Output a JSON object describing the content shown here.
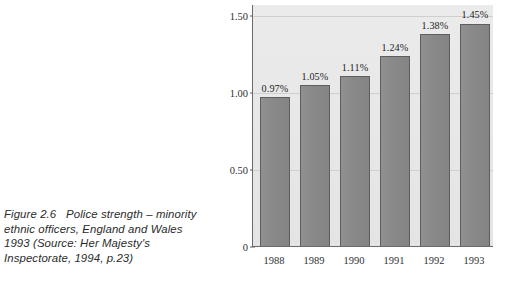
{
  "caption": {
    "lines": [
      "Figure 2.6   Police strength – minority",
      "ethnic officers, England and Wales",
      "1993 (Source: Her Majesty's",
      "Inspectorate, 1994, p.23)"
    ],
    "full_text": "Figure 2.6  Police strength – minority ethnic officers, England and Wales 1993 (Source: Her Majesty's Inspectorate, 1994, p.23)"
  },
  "colors": {
    "bar_fill": "#8b8b8b",
    "bar_border": "#5e5e5e",
    "plot_background": "#e8e8e8",
    "axis": "#6a6a6a",
    "gridline": "#cfcfcf",
    "text": "#2f2f2f",
    "page_background": "#ffffff"
  },
  "chart_data": {
    "type": "bar",
    "title": "",
    "xlabel": "",
    "ylabel": "Percentage",
    "categories": [
      "1988",
      "1989",
      "1990",
      "1991",
      "1992",
      "1993"
    ],
    "values": [
      0.97,
      1.05,
      1.11,
      1.24,
      1.38,
      1.45
    ],
    "data_labels": [
      "0.97%",
      "1.05%",
      "1.11%",
      "1.24%",
      "1.38%",
      "1.45%"
    ],
    "ylim": [
      0,
      1.57
    ],
    "yticks": [
      0,
      0.5,
      1.0,
      1.5
    ],
    "ytick_labels": [
      "0",
      "0.50",
      "1.00",
      "1.50"
    ],
    "grid": true,
    "legend": null
  }
}
